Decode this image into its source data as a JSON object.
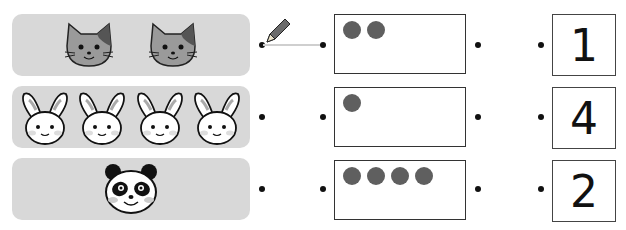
{
  "worksheet": {
    "rows": [
      {
        "animal": "cat",
        "animal_count": 2,
        "dot_box_count": 2,
        "number": "1"
      },
      {
        "animal": "rabbit",
        "animal_count": 4,
        "dot_box_count": 1,
        "number": "4"
      },
      {
        "animal": "panda",
        "animal_count": 1,
        "dot_box_count": 4,
        "number": "2"
      }
    ],
    "example_connection": {
      "from": "row-1-animal-dot",
      "to": "row-1-box-left-dot"
    },
    "icons": [
      "pencil-icon",
      "cat-face-icon",
      "rabbit-face-icon",
      "panda-face-icon",
      "counter-dot"
    ],
    "colors": {
      "panel_bg": "#d8d8d8",
      "counter": "#5f5f5f",
      "line": "#cfcfcf",
      "pencil": "#6b6b6b"
    }
  }
}
